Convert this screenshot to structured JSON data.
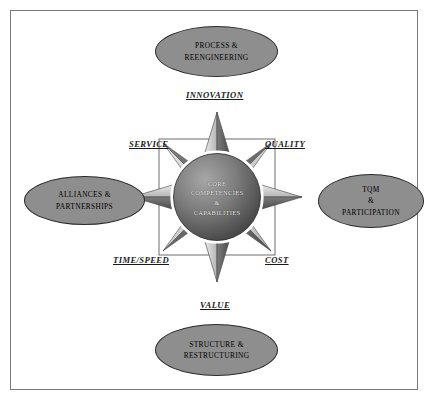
{
  "diagram": {
    "center": {
      "label": "CORE\nCOMPETENCIES\n&\nCAPABILITIES"
    },
    "nodes": [
      {
        "id": "process-reengineering",
        "label": "PROCESS &\nREENGINEERING",
        "position": "top"
      },
      {
        "id": "alliances-partnerships",
        "label": "ALLIANCES &\nPARTNERSHIPS",
        "position": "left"
      },
      {
        "id": "tqm-participation",
        "label": "TQM\n&\nPARTICIPATION",
        "position": "right"
      },
      {
        "id": "structure-restructuring",
        "label": "STRUCTURE &\nRESTRUCTURING",
        "position": "bottom"
      }
    ],
    "axes": [
      {
        "id": "innovation",
        "label": "INNOVATION",
        "direction": "north"
      },
      {
        "id": "quality",
        "label": "QUALITY",
        "direction": "northeast"
      },
      {
        "id": "cost",
        "label": "COST",
        "direction": "southeast"
      },
      {
        "id": "value",
        "label": "VALUE",
        "direction": "south"
      },
      {
        "id": "time-speed",
        "label": "TIME/SPEED",
        "direction": "southwest"
      },
      {
        "id": "service",
        "label": "SERVICE",
        "direction": "northwest"
      }
    ],
    "colors": {
      "ellipse_fill": "#8e8e8e",
      "ellipse_border": "#2b2b2b",
      "frame_border": "#7a7a7a",
      "background": "#ffffff",
      "star_light": "#d9d9d9",
      "star_dark": "#5a5a5a",
      "center_circle_light": "#9a9a9a",
      "center_circle_dark": "#3e3e3e",
      "center_ring": "#ffffff",
      "text": "#000000"
    }
  }
}
